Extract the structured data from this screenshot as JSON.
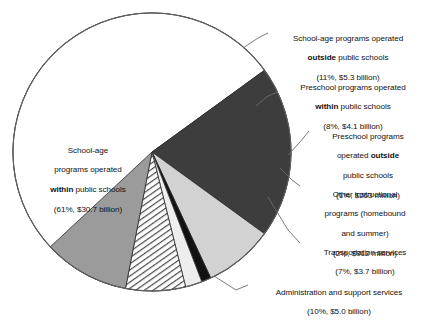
{
  "chart_data": {
    "type": "pie",
    "title": "",
    "subtitle": "",
    "xlabel": "",
    "ylabel": "",
    "legend_position": "callout-labels",
    "grid": false,
    "total_label": "",
    "categories": [
      "School-age programs operated within public schools",
      "School-age programs operated outside public schools",
      "Preschool programs operated within public schools",
      "Preschool programs operated outside public schools",
      "Other instructional programs (homebound and summer)",
      "Transportation services",
      "Administration and support services"
    ],
    "values": [
      61,
      11,
      8,
      1,
      2,
      7,
      10
    ],
    "amounts": [
      "$30.7 billion",
      "$5.3 billion",
      "$4.1 billion",
      "$263 million",
      "$912 million",
      "$3.7 billion",
      "$5.0 billion"
    ],
    "slices": [
      {
        "key": "school_age_within",
        "percent": 61,
        "percent_text": "61%",
        "amount": "$30.7 billion",
        "fill": "#ffffff",
        "pattern": "solid",
        "start_deg": 104,
        "end_deg": 324
      },
      {
        "key": "school_age_outside",
        "percent": 11,
        "percent_text": "11%",
        "amount": "$5.3 billion",
        "fill": "#3d3d3d",
        "pattern": "solid",
        "start_deg": 324,
        "end_deg": 36
      },
      {
        "key": "preschool_within",
        "percent": 8,
        "percent_text": "8%",
        "amount": "$4.1 billion",
        "fill": "#d2d2d2",
        "pattern": "solid",
        "start_deg": 36,
        "end_deg": 65
      },
      {
        "key": "preschool_outside",
        "percent": 1,
        "percent_text": "1%",
        "amount": "$263 million",
        "fill": "#121212",
        "pattern": "solid",
        "start_deg": 65,
        "end_deg": 69
      },
      {
        "key": "other_instructional",
        "percent": 2,
        "percent_text": "2%",
        "amount": "$912 million",
        "fill": "#eeeeee",
        "pattern": "solid",
        "start_deg": 69,
        "end_deg": 76
      },
      {
        "key": "transportation",
        "percent": 7,
        "percent_text": "7%",
        "amount": "$3.7 billion",
        "fill": "#ffffff",
        "pattern": "diagonal-hatch",
        "start_deg": 76,
        "end_deg": 101
      },
      {
        "key": "administration",
        "percent": 10,
        "percent_text": "10%",
        "amount": "$5.0 billion",
        "fill": "#9b9b9b",
        "pattern": "solid",
        "start_deg": 101,
        "end_deg": 137
      }
    ],
    "geometry": {
      "cx": 152,
      "cy": 152,
      "r": 139
    },
    "colors": {
      "dark_gray": "#3d3d3d",
      "light_gray": "#d2d2d2",
      "very_light_gray": "#eeeeee",
      "medium_gray": "#9b9b9b",
      "black": "#121212",
      "outline": "#555555",
      "white": "#ffffff"
    }
  },
  "labels": {
    "school_age_within": {
      "line1": "School-age",
      "line2": "programs operated",
      "line3_bold": "within",
      "line3_rest": " public schools",
      "line4": "(61%, $30.7 billion)"
    },
    "school_age_outside": {
      "line1": "School-age programs operated",
      "line2_bold": "outside",
      "line2_rest": " public schools",
      "line3": "(11%, $5.3 billion)"
    },
    "preschool_within": {
      "line1": "Preschool programs operated",
      "line2_bold": "within",
      "line2_rest": " public schools",
      "line3": "(8%, $4.1 billion)"
    },
    "preschool_outside": {
      "line1": "Preschool programs",
      "line2_rest": "operated ",
      "line2_bold": "outside",
      "line3": "public schools",
      "line4": "(1%, $263 million)"
    },
    "other_instructional": {
      "line1": "Other instructional",
      "line2": "programs (homebound",
      "line3": "and summer)",
      "line4": "(2%, $912 million)"
    },
    "transportation": {
      "line1": "Transportation services",
      "line2": "(7%, $3.7 billion)"
    },
    "administration": {
      "line1": "Administration and support services",
      "line2": "(10%, $5.0 billion)"
    }
  }
}
